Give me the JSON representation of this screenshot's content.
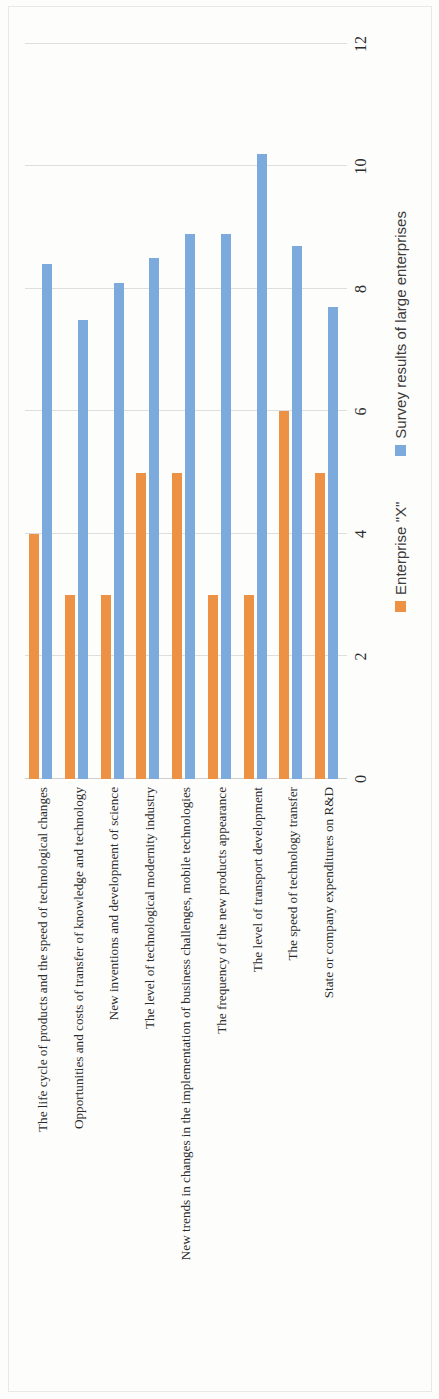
{
  "chart_data": {
    "type": "bar",
    "orientation": "grouped-columns",
    "title": "",
    "xlabel": "",
    "ylabel": "",
    "ylim": [
      0,
      12
    ],
    "yticks": [
      "0",
      "2",
      "4",
      "6",
      "8",
      "10",
      "12"
    ],
    "grid": true,
    "legend_position": "bottom",
    "categories": [
      "The life cycle of products and the speed of technological changes",
      "Opportunities and costs of transfer of knowledge and technology",
      "New inventions and development of science",
      "The level of technological modernity industry",
      "New trends in changes in the implementation of business challenges, mobile technologies",
      "The frequency of the new products appearance",
      "The level of transport development",
      "The speed of technology transfer",
      "State or company expenditures on R&D"
    ],
    "series": [
      {
        "name": "Enterprise \"X\"",
        "color": "#ED9144",
        "values": [
          4,
          3,
          3,
          5,
          5,
          3,
          3,
          6,
          5
        ]
      },
      {
        "name": "Survey results of large enterprises",
        "color": "#7CAADC",
        "values": [
          8.4,
          7.5,
          8.1,
          8.5,
          8.9,
          8.9,
          10.2,
          8.7,
          7.7
        ]
      }
    ]
  },
  "legend": {
    "items": [
      {
        "label": "Enterprise \"X\"",
        "color": "#ED9144",
        "swatch": "legend-swatch-orange"
      },
      {
        "label": "Survey results of large enterprises",
        "color": "#7CAADC",
        "swatch": "legend-swatch-blue"
      }
    ]
  },
  "axis": {
    "value_ticks": [
      "0",
      "2",
      "4",
      "6",
      "8",
      "10",
      "12"
    ]
  },
  "colors": {
    "series_enterprise": "#ED9144",
    "series_survey": "#7CAADC",
    "gridline": "#dedede",
    "text": "#2b2b2b",
    "page_background": "#fdfdfc"
  }
}
